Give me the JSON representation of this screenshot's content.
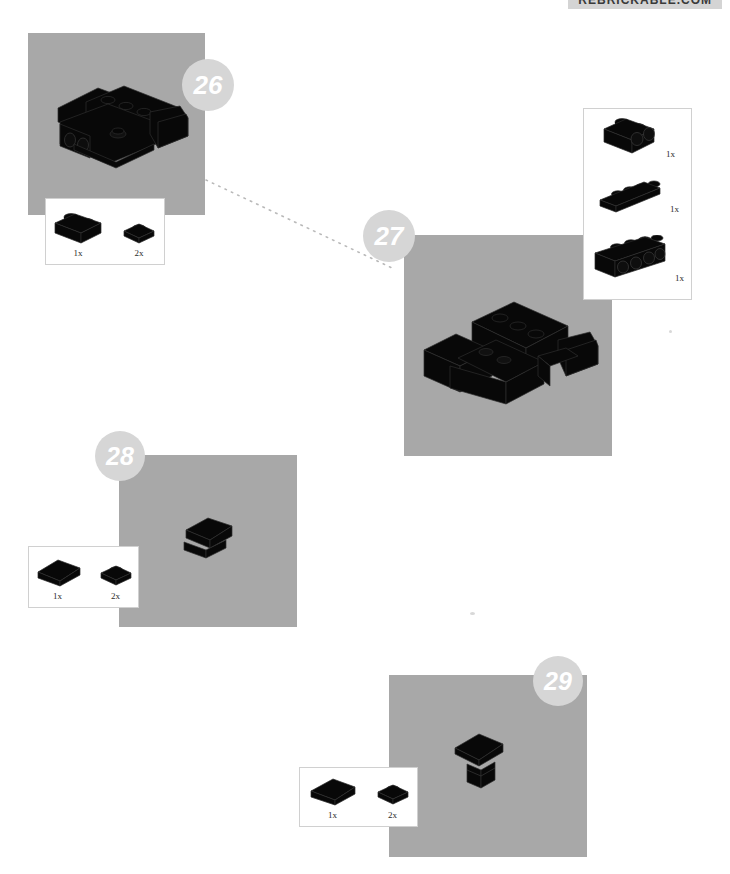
{
  "page": {
    "width": 730,
    "height": 874,
    "background": "#ffffff",
    "panel_color": "#a8a8a8",
    "badge_color": "#d6d6d6",
    "badge_text_color": "#ffffff",
    "part_color": "#000000",
    "callout_border": "#d0d0d0",
    "connector_color": "#b9b9b9"
  },
  "header": {
    "site_label": "REBRICKABLE.COM",
    "banner_color": "#d4d4d4"
  },
  "steps": [
    {
      "id": "step-26",
      "number": "26",
      "panel": {
        "x": 28,
        "y": 33,
        "w": 177,
        "h": 182
      },
      "badge": {
        "cx": 208,
        "cy": 85,
        "r": 26,
        "font_size": 26
      },
      "callout": {
        "x": 45,
        "y": 198,
        "w": 120,
        "h": 67,
        "orientation": "horizontal",
        "parts": [
          {
            "name": "brick-1x2",
            "qty": "1x"
          },
          {
            "name": "plate-1x1",
            "qty": "2x"
          }
        ]
      },
      "model": {
        "name": "chassis-assembly-26"
      }
    },
    {
      "id": "step-27",
      "number": "27",
      "panel": {
        "x": 404,
        "y": 235,
        "w": 208,
        "h": 221
      },
      "badge": {
        "cx": 389,
        "cy": 236,
        "r": 26,
        "font_size": 26
      },
      "callout": {
        "x": 583,
        "y": 108,
        "w": 109,
        "h": 192,
        "orientation": "vertical",
        "parts": [
          {
            "name": "brick-1x2-with-holes",
            "qty": "1x"
          },
          {
            "name": "plate-1x4",
            "qty": "1x"
          },
          {
            "name": "brick-1x4-with-holes",
            "qty": "1x"
          }
        ]
      },
      "model": {
        "name": "chassis-assembly-27"
      }
    },
    {
      "id": "step-28",
      "number": "28",
      "panel": {
        "x": 119,
        "y": 455,
        "w": 178,
        "h": 172
      },
      "badge": {
        "cx": 120,
        "cy": 456,
        "r": 25,
        "font_size": 25
      },
      "callout": {
        "x": 28,
        "y": 546,
        "w": 111,
        "h": 62,
        "orientation": "horizontal",
        "parts": [
          {
            "name": "slope-brick-2x1",
            "qty": "1x"
          },
          {
            "name": "plate-1x1",
            "qty": "2x"
          }
        ]
      },
      "model": {
        "name": "roof-assembly-28"
      }
    },
    {
      "id": "step-29",
      "number": "29",
      "panel": {
        "x": 389,
        "y": 675,
        "w": 198,
        "h": 182
      },
      "badge": {
        "cx": 558,
        "cy": 681,
        "r": 25,
        "font_size": 25
      },
      "callout": {
        "x": 299,
        "y": 767,
        "w": 119,
        "h": 60,
        "orientation": "horizontal",
        "parts": [
          {
            "name": "slope-brick-2x1",
            "qty": "1x"
          },
          {
            "name": "plate-1x1",
            "qty": "2x"
          }
        ]
      },
      "model": {
        "name": "roof-assembly-29"
      }
    }
  ],
  "connector": {
    "name": "step-26-to-27-dotted-line",
    "from": {
      "x": 206,
      "y": 180
    },
    "to": {
      "x": 392,
      "y": 268
    },
    "style": "dotted",
    "color": "#b9b9b9"
  }
}
